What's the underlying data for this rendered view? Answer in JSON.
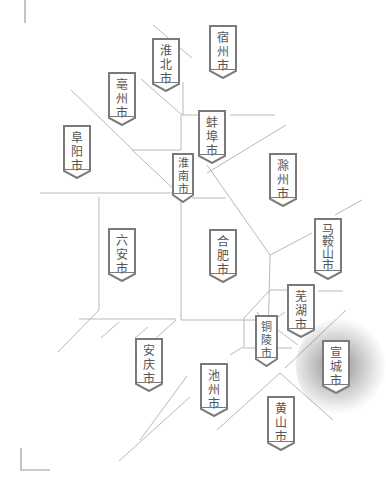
{
  "map": {
    "title": "安徽省城市示意图",
    "cities": [
      {
        "name": "宿州市",
        "chars": [
          "宿",
          "州",
          "市"
        ],
        "x": 209,
        "y": 25
      },
      {
        "name": "淮北市",
        "chars": [
          "淮",
          "北",
          "市"
        ],
        "x": 152,
        "y": 38
      },
      {
        "name": "亳州市",
        "chars": [
          "亳",
          "州",
          "市"
        ],
        "x": 108,
        "y": 72
      },
      {
        "name": "蚌埠市",
        "chars": [
          "蚌",
          "埠",
          "市"
        ],
        "x": 198,
        "y": 110
      },
      {
        "name": "阜阳市",
        "chars": [
          "阜",
          "阳",
          "市"
        ],
        "x": 63,
        "y": 125
      },
      {
        "name": "淮南市",
        "chars": [
          "淮",
          "南",
          "市"
        ],
        "x": 172,
        "y": 153
      },
      {
        "name": "滁州市",
        "chars": [
          "滁",
          "州",
          "市"
        ],
        "x": 269,
        "y": 153
      },
      {
        "name": "马鞍山市",
        "chars": [
          "马",
          "鞍",
          "山",
          "市"
        ],
        "x": 314,
        "y": 218
      },
      {
        "name": "六安市",
        "chars": [
          "六",
          "安",
          "市"
        ],
        "x": 108,
        "y": 228
      },
      {
        "name": "合肥市",
        "chars": [
          "合",
          "肥",
          "市"
        ],
        "x": 209,
        "y": 229
      },
      {
        "name": "芜湖市",
        "chars": [
          "芜",
          "湖",
          "市"
        ],
        "x": 287,
        "y": 284
      },
      {
        "name": "铜陵市",
        "chars": [
          "铜",
          "陵",
          "市"
        ],
        "x": 255,
        "y": 315
      },
      {
        "name": "宣城市",
        "chars": [
          "宣",
          "城",
          "市"
        ],
        "x": 322,
        "y": 340,
        "highlighted": true
      },
      {
        "name": "安庆市",
        "chars": [
          "安",
          "庆",
          "市"
        ],
        "x": 135,
        "y": 338
      },
      {
        "name": "池州市",
        "chars": [
          "池",
          "州",
          "市"
        ],
        "x": 200,
        "y": 363
      },
      {
        "name": "黄山市",
        "chars": [
          "黄",
          "山",
          "市"
        ],
        "x": 267,
        "y": 396
      }
    ],
    "colors": {
      "border_line": "#b9b9b9",
      "badge_border": "#7a7a7a",
      "badge_text": "#555555",
      "highlight_shadow": "#000000"
    }
  }
}
